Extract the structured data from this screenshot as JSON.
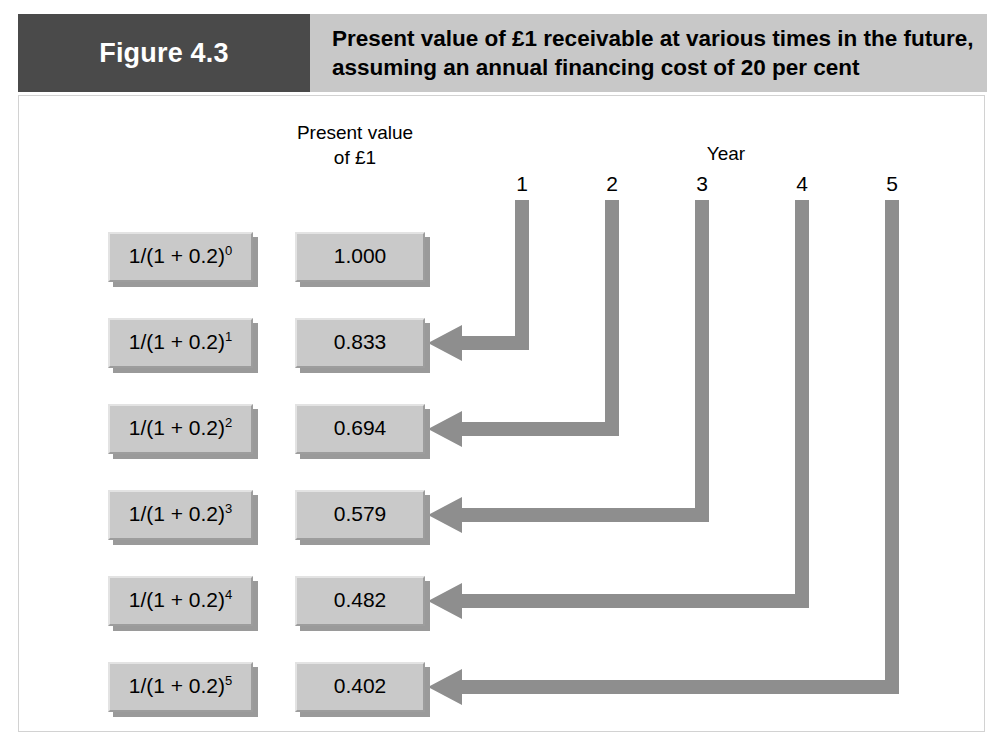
{
  "header": {
    "figure_label": "Figure 4.3",
    "title_line1": "Present value of £1 receivable at various times in the future,",
    "title_line2": "assuming an annual financing cost of 20 per cent",
    "label_bg": "#4a4a4a",
    "title_bg": "#c8c8c8"
  },
  "labels": {
    "pv_head_line1": "Present value",
    "pv_head_line2": "of £1",
    "year_head": "Year"
  },
  "years": [
    {
      "label": "1"
    },
    {
      "label": "2"
    },
    {
      "label": "3"
    },
    {
      "label": "4"
    },
    {
      "label": "5"
    }
  ],
  "rows": [
    {
      "formula_base": "1/(1 + 0.2)",
      "exponent": "0",
      "value": "1.000",
      "has_arrow": false,
      "year": null
    },
    {
      "formula_base": "1/(1 + 0.2)",
      "exponent": "1",
      "value": "0.833",
      "has_arrow": true,
      "year": "1"
    },
    {
      "formula_base": "1/(1 + 0.2)",
      "exponent": "2",
      "value": "0.694",
      "has_arrow": true,
      "year": "2"
    },
    {
      "formula_base": "1/(1 + 0.2)",
      "exponent": "3",
      "value": "0.579",
      "has_arrow": true,
      "year": "3"
    },
    {
      "formula_base": "1/(1 + 0.2)",
      "exponent": "4",
      "value": "0.482",
      "has_arrow": true,
      "year": "4"
    },
    {
      "formula_base": "1/(1 + 0.2)",
      "exponent": "5",
      "value": "0.402",
      "has_arrow": true,
      "year": "5"
    }
  ],
  "colors": {
    "arrow": "#8e8e8e",
    "box_face": "#c9c9c9",
    "box_shadow": "#9a9a9a",
    "panel_border": "#d2d2d2"
  },
  "chart_data": {
    "type": "diagram",
    "title": "Present value of £1 receivable at various times in the future, assuming an annual financing cost of 20 per cent",
    "discount_rate": 0.2,
    "xlabel": "Year",
    "ylabel": "Present value of £1",
    "categories": [
      "0",
      "1",
      "2",
      "3",
      "4",
      "5"
    ],
    "values": [
      1.0,
      0.833,
      0.694,
      0.579,
      0.482,
      0.402
    ],
    "formulas": [
      "1/(1 + 0.2)^0",
      "1/(1 + 0.2)^1",
      "1/(1 + 0.2)^2",
      "1/(1 + 0.2)^3",
      "1/(1 + 0.2)^4",
      "1/(1 + 0.2)^5"
    ],
    "year_markers": [
      "1",
      "2",
      "3",
      "4",
      "5"
    ],
    "legend": [],
    "grid": false
  }
}
